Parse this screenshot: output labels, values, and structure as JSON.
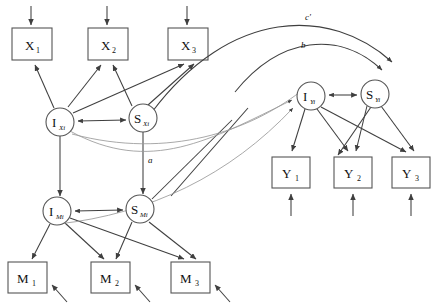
{
  "diagram": {
    "type": "path-diagram",
    "observed_indicators": {
      "x": [
        {
          "id": "x1",
          "label": "X",
          "subscript": "1",
          "cx": 32,
          "cy": 44
        },
        {
          "id": "x2",
          "label": "X",
          "subscript": "2",
          "cx": 108,
          "cy": 44
        },
        {
          "id": "x3",
          "label": "X",
          "subscript": "3",
          "cx": 188,
          "cy": 44
        }
      ],
      "m": [
        {
          "id": "m1",
          "label": "M",
          "subscript": "1",
          "cx": 27,
          "cy": 277
        },
        {
          "id": "m2",
          "label": "M",
          "subscript": "2",
          "cx": 110,
          "cy": 277
        },
        {
          "id": "m3",
          "label": "M",
          "subscript": "3",
          "cx": 190,
          "cy": 277
        }
      ],
      "y": [
        {
          "id": "y1",
          "label": "Y",
          "subscript": "1",
          "cx": 291,
          "cy": 172
        },
        {
          "id": "y2",
          "label": "Y",
          "subscript": "2",
          "cx": 353,
          "cy": 172
        },
        {
          "id": "y3",
          "label": "Y",
          "subscript": "3",
          "cx": 411,
          "cy": 172
        }
      ]
    },
    "latent_factors": [
      {
        "id": "ix",
        "label": "I",
        "subscript": "Xi",
        "cx": 60,
        "cy": 122
      },
      {
        "id": "sx",
        "label": "S",
        "subscript": "Xi",
        "cx": 143,
        "cy": 118
      },
      {
        "id": "im",
        "label": "I",
        "subscript": "Mi",
        "cx": 57,
        "cy": 211
      },
      {
        "id": "sm",
        "label": "S",
        "subscript": "Mi",
        "cx": 140,
        "cy": 209
      },
      {
        "id": "iy",
        "label": "I",
        "subscript": "Yi",
        "cx": 311,
        "cy": 96
      },
      {
        "id": "sy",
        "label": "S",
        "subscript": "Yi",
        "cx": 375,
        "cy": 94
      }
    ],
    "path_labels": [
      {
        "id": "a",
        "text": "a",
        "x": 148,
        "y": 163
      },
      {
        "id": "b",
        "text": "b",
        "x": 301,
        "y": 48
      },
      {
        "id": "cprime",
        "text": "c'",
        "x": 305,
        "y": 20
      }
    ],
    "notes": {
      "covariances": "double-headed arrows between intercept and slope factors",
      "residuals": "single-headed arrows into each observed indicator box"
    }
  }
}
